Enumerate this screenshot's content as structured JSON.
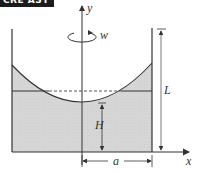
{
  "banner": {
    "text": "CRE ASY",
    "background": "#1c1c1c",
    "color": "#ffffff"
  },
  "diagram": {
    "labels": {
      "y_axis": "y",
      "x_axis": "x",
      "rotation": "w",
      "height_liquid_min": "H",
      "container_height": "L",
      "radius": "a"
    },
    "colors": {
      "liquid_fill": "#d9d9d9",
      "line": "#333333",
      "dashed": "#444444"
    }
  }
}
